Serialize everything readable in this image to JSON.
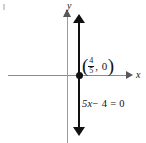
{
  "chart_data": {
    "type": "line",
    "title": "",
    "xlabel": "x",
    "ylabel": "y",
    "equation": "5x − 4 = 0",
    "equation_parts": {
      "coefficient_term": "5x",
      "minus": "−",
      "constant": "4",
      "equals": "=",
      "rhs": "0"
    },
    "grid": false,
    "legend": null,
    "series": [
      {
        "name": "5x - 4 = 0",
        "kind": "vertical-line",
        "x_value": 0.8,
        "arrows": [
          "up",
          "down"
        ],
        "color": "#111111"
      }
    ],
    "points": [
      {
        "label": "(4/5, 0)",
        "x_numerator": "4",
        "x_denominator": "5",
        "y": "0",
        "marker": "filled-circle"
      }
    ],
    "axes": {
      "x": {
        "label": "x",
        "arrow": "right",
        "color": "#8a8a8a"
      },
      "y": {
        "label": "y",
        "arrow": "up",
        "color": "#9a9a9a"
      }
    }
  },
  "figure": {
    "axis_labels": {
      "x": "x",
      "y": "y"
    },
    "point_label": {
      "open_paren": "(",
      "numerator": "4",
      "denominator": "5",
      "comma_zero": ", 0",
      "close_paren": ")"
    },
    "equation": {
      "lhs_term": "5x",
      "minus_const": "− 4",
      "eq_rhs": "= 0"
    }
  },
  "colors": {
    "background": "#ffffff",
    "axis": "#8a8a8a",
    "plot_line": "#111111",
    "text": "#111111"
  }
}
